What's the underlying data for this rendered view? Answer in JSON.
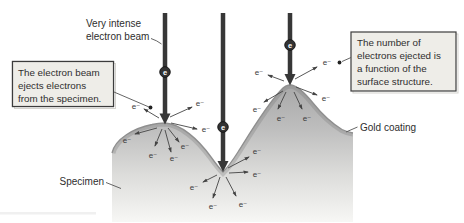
{
  "diagram": {
    "beam_label": {
      "line1": "Very intense",
      "line2": "electron beam"
    },
    "left_callout": {
      "line1": "The electron beam",
      "line2": "ejects electrons",
      "line3": "from the specimen."
    },
    "right_callout": {
      "line1": "The number of",
      "line2": "electrons ejected is",
      "line3": "a function of the",
      "line4": "surface structure."
    },
    "gold_coating_label": "Gold coating",
    "specimen_label": "Specimen",
    "electron_symbol": "e⁻",
    "beam_electron_symbol": "e",
    "beam_count": 3,
    "colors": {
      "background": "#ffffff",
      "beam": "#373737",
      "specimen_top": "#a8a8a8",
      "specimen_bottom": "#f7f7f5",
      "coating_line": "#8f8f8f",
      "callout_fill": "#eeede8",
      "callout_border": "#3c3c3c",
      "arrow": "#444444"
    }
  }
}
